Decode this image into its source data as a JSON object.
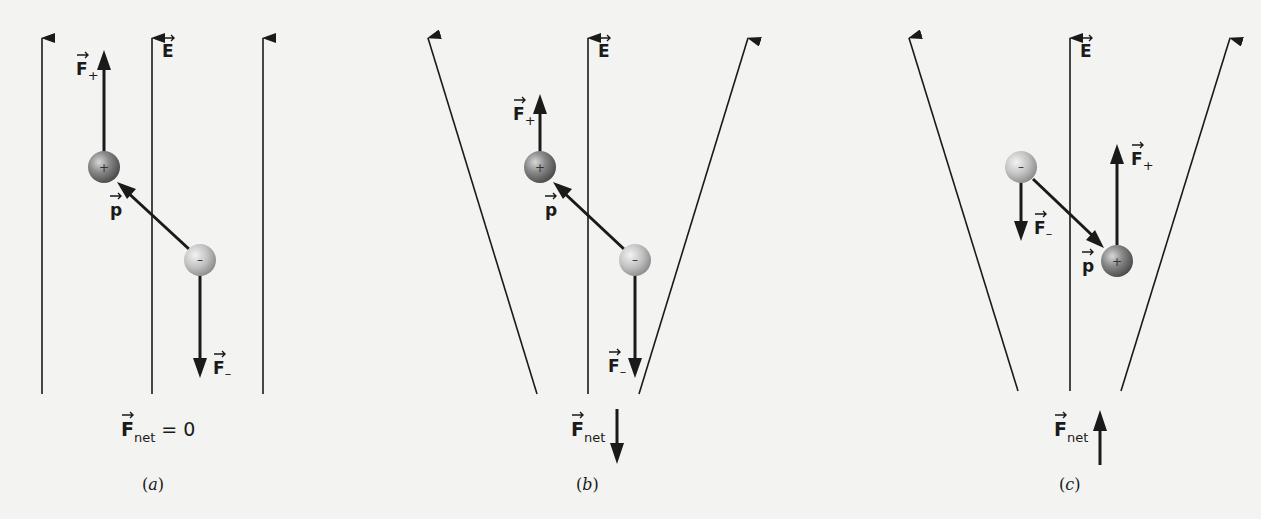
{
  "figure": {
    "colors": {
      "background": "#f3f3f1",
      "line": "#1a1a1a",
      "positive_sphere": "#7a7a7a",
      "negative_sphere": "#c8c8c8"
    },
    "symbols": {
      "field": "E",
      "dipole": "p",
      "force": "F",
      "plus_sub": "+",
      "minus_sub": "–",
      "net_sub": "net",
      "plus_charge": "+",
      "minus_charge": "–"
    },
    "panels": [
      {
        "id": "a",
        "caption_open": "(",
        "caption_letter": "a",
        "caption_close": ")",
        "field_type": "uniform",
        "net_force_label": "= 0",
        "net_force_direction": "zero",
        "dipole_orientation": "negative lower-right, positive upper-left"
      },
      {
        "id": "b",
        "caption_open": "(",
        "caption_letter": "b",
        "caption_close": ")",
        "field_type": "diverging (stronger at bottom)",
        "net_force_direction": "down",
        "dipole_orientation": "negative lower-right, positive upper-left"
      },
      {
        "id": "c",
        "caption_open": "(",
        "caption_letter": "c",
        "caption_close": ")",
        "field_type": "diverging (stronger at bottom)",
        "net_force_direction": "up",
        "dipole_orientation": "negative upper-left, positive lower-right"
      }
    ]
  }
}
